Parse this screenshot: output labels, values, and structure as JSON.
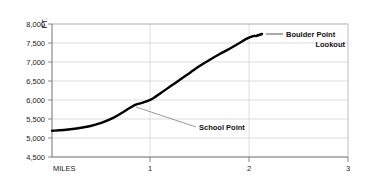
{
  "chart_data": {
    "type": "line",
    "title": "",
    "xlabel": "MILES",
    "ylabel": "FT.",
    "xlim": [
      0,
      3
    ],
    "ylim": [
      4500,
      8000
    ],
    "grid": true,
    "legend_position": "none",
    "y_ticks": [
      "4,500",
      "5,000",
      "5,500",
      "6,000",
      "6,500",
      "7,000",
      "7,500",
      "8,000"
    ],
    "y_tick_values": [
      4500,
      5000,
      5500,
      6000,
      6500,
      7000,
      7500,
      8000
    ],
    "x_ticks": [
      "1",
      "2",
      "3"
    ],
    "x_tick_values": [
      1,
      2,
      3
    ],
    "series": [
      {
        "name": "Trail elevation profile",
        "x": [
          0.0,
          0.12,
          0.25,
          0.38,
          0.5,
          0.62,
          0.72,
          0.8,
          0.85,
          0.92,
          1.0,
          1.1,
          1.2,
          1.3,
          1.4,
          1.5,
          1.6,
          1.7,
          1.8,
          1.9,
          1.98,
          2.05
        ],
        "values": [
          5190,
          5210,
          5250,
          5310,
          5400,
          5530,
          5680,
          5810,
          5880,
          5930,
          6010,
          6180,
          6360,
          6540,
          6720,
          6900,
          7060,
          7210,
          7350,
          7500,
          7620,
          7690
        ]
      }
    ],
    "annotations": [
      {
        "name": "school-point",
        "label": "School Point",
        "x": 0.85,
        "y": 5880,
        "label_lines": [
          "School Point"
        ],
        "align": "left"
      },
      {
        "name": "boulder-point-lookout",
        "label": "Boulder Point Lookout",
        "x": 2.05,
        "y": 7690,
        "label_lines": [
          "Boulder Point",
          "Lookout"
        ],
        "align": "right"
      }
    ],
    "colors": {
      "curve": "#000000",
      "grid": "#c8c8c8",
      "frame": "#b0b0b0",
      "text": "#1a1a1a",
      "leader": "#5a5a5a",
      "background": "#ffffff"
    }
  }
}
